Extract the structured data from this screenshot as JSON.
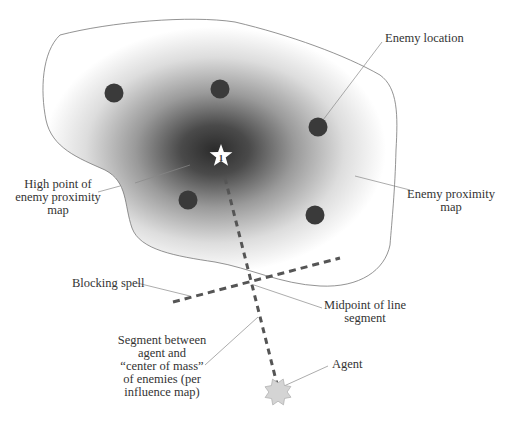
{
  "diagram": {
    "colors": {
      "enemy_dot": "#3a3a3a",
      "outline": "#777777",
      "dashed_line": "#555555",
      "influence_center": "#2e2e2e",
      "agent_fill": "#d4d4d4",
      "leader_line": "#888888"
    },
    "nodes": [
      {
        "id": "enemy-1",
        "kind": "enemy",
        "x": 114,
        "y": 93
      },
      {
        "id": "enemy-2",
        "kind": "enemy",
        "x": 220,
        "y": 89
      },
      {
        "id": "enemy-3",
        "kind": "enemy",
        "x": 318,
        "y": 127
      },
      {
        "id": "enemy-4",
        "kind": "enemy",
        "x": 188,
        "y": 200
      },
      {
        "id": "enemy-5",
        "kind": "enemy",
        "x": 315,
        "y": 215
      },
      {
        "id": "high-point",
        "kind": "star",
        "x": 221,
        "y": 156,
        "label": "1"
      },
      {
        "id": "agent",
        "kind": "agent",
        "x": 278,
        "y": 392
      }
    ],
    "edges": [
      {
        "id": "agent-segment",
        "from": "high-point",
        "to": "agent",
        "style": "dashed"
      },
      {
        "id": "blocking-spell",
        "from": [
          173,
          302
        ],
        "to": [
          340,
          258
        ],
        "style": "dashed"
      }
    ],
    "labels": {
      "enemy_location": [
        "Enemy location"
      ],
      "high_point": [
        "High point of",
        "enemy proximity",
        "map"
      ],
      "proximity_map": [
        "Enemy proximity",
        "map"
      ],
      "blocking_spell": [
        "Blocking spell"
      ],
      "midpoint": [
        "Midpoint of line",
        "segment"
      ],
      "segment": [
        "Segment between",
        "agent and",
        "“center of mass”",
        "of enemies (per",
        "influence map)"
      ],
      "agent": [
        "Agent"
      ]
    },
    "star_label": "1"
  }
}
